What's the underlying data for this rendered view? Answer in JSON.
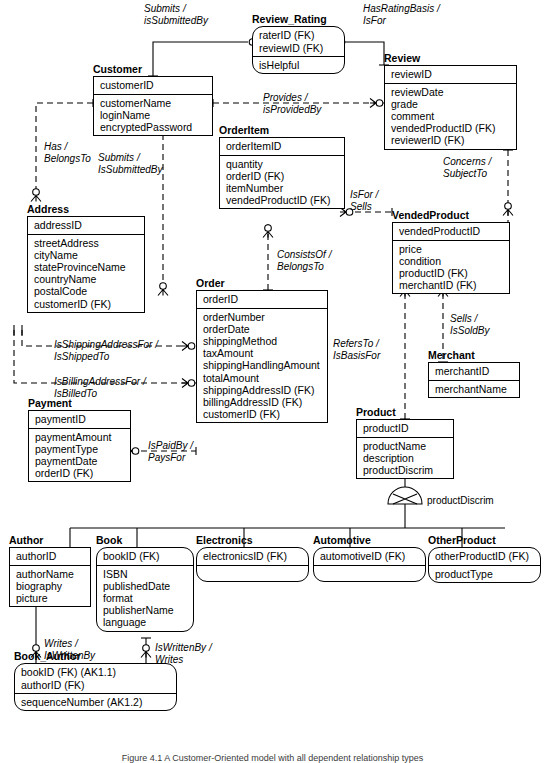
{
  "diagram": {
    "caption": "Figure 4.1 A Customer-Oriented model with all dependent relationship types",
    "discriminator_label": "productDiscrim"
  },
  "entities": [
    {
      "id": "customer",
      "name": "Customer",
      "style": "square",
      "pk": [
        "customerID"
      ],
      "attrs": [
        "customerName",
        "loginName",
        "encryptedPassword"
      ]
    },
    {
      "id": "review_rating",
      "name": "Review_Rating",
      "style": "rounded",
      "pk": [
        "raterID (FK)",
        "reviewID (FK)"
      ],
      "attrs": [
        "isHelpful"
      ]
    },
    {
      "id": "review",
      "name": "Review",
      "style": "square",
      "pk": [
        "reviewID"
      ],
      "attrs": [
        "reviewDate",
        "grade",
        "comment",
        "vendedProductID (FK)",
        "reviewerID (FK)"
      ]
    },
    {
      "id": "orderitem",
      "name": "OrderItem",
      "style": "square",
      "pk": [
        "orderItemID"
      ],
      "attrs": [
        "quantity",
        "orderID (FK)",
        "itemNumber",
        "vendedProductID (FK)"
      ]
    },
    {
      "id": "address",
      "name": "Address",
      "style": "square",
      "pk": [
        "addressID"
      ],
      "attrs": [
        "streetAddress",
        "cityName",
        "stateProvinceName",
        "countryName",
        "postalCode",
        "customerID (FK)"
      ]
    },
    {
      "id": "vendedproduct",
      "name": "VendedProduct",
      "style": "square",
      "pk": [
        "vendedProductID"
      ],
      "attrs": [
        "price",
        "condition",
        "productID (FK)",
        "merchantID (FK)"
      ]
    },
    {
      "id": "order",
      "name": "Order",
      "style": "square",
      "pk": [
        "orderID"
      ],
      "attrs": [
        "orderNumber",
        "orderDate",
        "shippingMethod",
        "taxAmount",
        "shippingHandlingAmount",
        "totalAmount",
        "shippingAddressID (FK)",
        "billingAddressID (FK)",
        "customerID (FK)"
      ]
    },
    {
      "id": "merchant",
      "name": "Merchant",
      "style": "square",
      "pk": [
        "merchantID"
      ],
      "attrs": [
        "merchantName"
      ]
    },
    {
      "id": "payment",
      "name": "Payment",
      "style": "square",
      "pk": [
        "paymentID"
      ],
      "attrs": [
        "paymentAmount",
        "paymentType",
        "paymentDate",
        "orderID (FK)"
      ]
    },
    {
      "id": "product",
      "name": "Product",
      "style": "square",
      "pk": [
        "productID"
      ],
      "attrs": [
        "productName",
        "description",
        "productDiscrim"
      ]
    },
    {
      "id": "author",
      "name": "Author",
      "style": "square",
      "pk": [
        "authorID"
      ],
      "attrs": [
        "authorName",
        "biography",
        "picture"
      ]
    },
    {
      "id": "book",
      "name": "Book",
      "style": "rounded",
      "pk": [
        "bookID (FK)"
      ],
      "attrs": [
        "ISBN",
        "publishedDate",
        "format",
        "publisherName",
        "language"
      ]
    },
    {
      "id": "electronics",
      "name": "Electronics",
      "style": "rounded",
      "pk": [
        "electronicsID (FK)"
      ],
      "attrs": []
    },
    {
      "id": "automotive",
      "name": "Automotive",
      "style": "rounded",
      "pk": [
        "automotiveID (FK)"
      ],
      "attrs": []
    },
    {
      "id": "otherproduct",
      "name": "OtherProduct",
      "style": "rounded",
      "pk": [
        "otherProductID (FK)"
      ],
      "attrs": [
        "productType"
      ]
    },
    {
      "id": "book_author",
      "name": "Book_Author",
      "style": "rounded",
      "pk": [
        "bookID (FK) (AK1.1)",
        "authorID (FK)"
      ],
      "attrs": [
        "sequenceNumber (AK1.2)"
      ]
    }
  ],
  "relationships": [
    {
      "id": "submits-review",
      "line1": "Submits /",
      "line2": "isSubmittedBy"
    },
    {
      "id": "hasratingbasis",
      "line1": "HasRatingBasis /",
      "line2": "IsFor"
    },
    {
      "id": "provides",
      "line1": "Provides /",
      "line2": "isProvidedBy"
    },
    {
      "id": "has-address",
      "line1": "Has /",
      "line2": "BelongsTo"
    },
    {
      "id": "submits-order",
      "line1": "Submits /",
      "line2": "IsSubmittedBy"
    },
    {
      "id": "concerns",
      "line1": "Concerns /",
      "line2": "SubjectTo"
    },
    {
      "id": "isfor-sells",
      "line1": "IsFor /",
      "line2": "Sells"
    },
    {
      "id": "consistsof",
      "line1": "ConsistsOf /",
      "line2": "BelongsTo"
    },
    {
      "id": "shipping-address",
      "line1": "IsShippingAddressFor /",
      "line2": "IsShippedTo"
    },
    {
      "id": "billing-address",
      "line1": "IsBillingAddressFor /",
      "line2": "IsBilledTo"
    },
    {
      "id": "refersto",
      "line1": "RefersTo /",
      "line2": "IsBasisFor"
    },
    {
      "id": "sells-issoldby",
      "line1": "Sells /",
      "line2": "IsSoldBy"
    },
    {
      "id": "ispaidby",
      "line1": "IsPaidBy /",
      "line2": "PaysFor"
    },
    {
      "id": "writes-author",
      "line1": "Writes /",
      "line2": "IsWrittenBy"
    },
    {
      "id": "writes-book",
      "line1": "IsWrittenBy /",
      "line2": "Writes"
    }
  ]
}
